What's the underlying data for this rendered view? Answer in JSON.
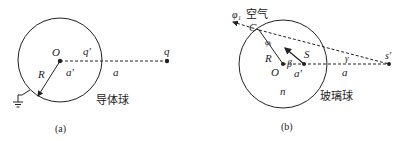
{
  "panel_a": {
    "caption": "(a)",
    "center_label": "O",
    "image_charge_label": "q'",
    "charge_label": "q",
    "radius_label": "R",
    "inner_distance_label": "a'",
    "outer_distance_label": "a",
    "body_label": "导体球"
  },
  "panel_b": {
    "caption": "(b)",
    "center_label": "O",
    "source_label": "S",
    "image_label": "s'",
    "radius_label": "R",
    "point_label": "C",
    "angle_out_label": "φ₁",
    "medium_label": "空气",
    "angle_in_label": "φᵢ",
    "beta_label": "β",
    "gamma_label": "γ",
    "inner_distance_label": "a'",
    "outer_distance_label": "a",
    "index_label": "n",
    "body_label": "玻璃球"
  }
}
